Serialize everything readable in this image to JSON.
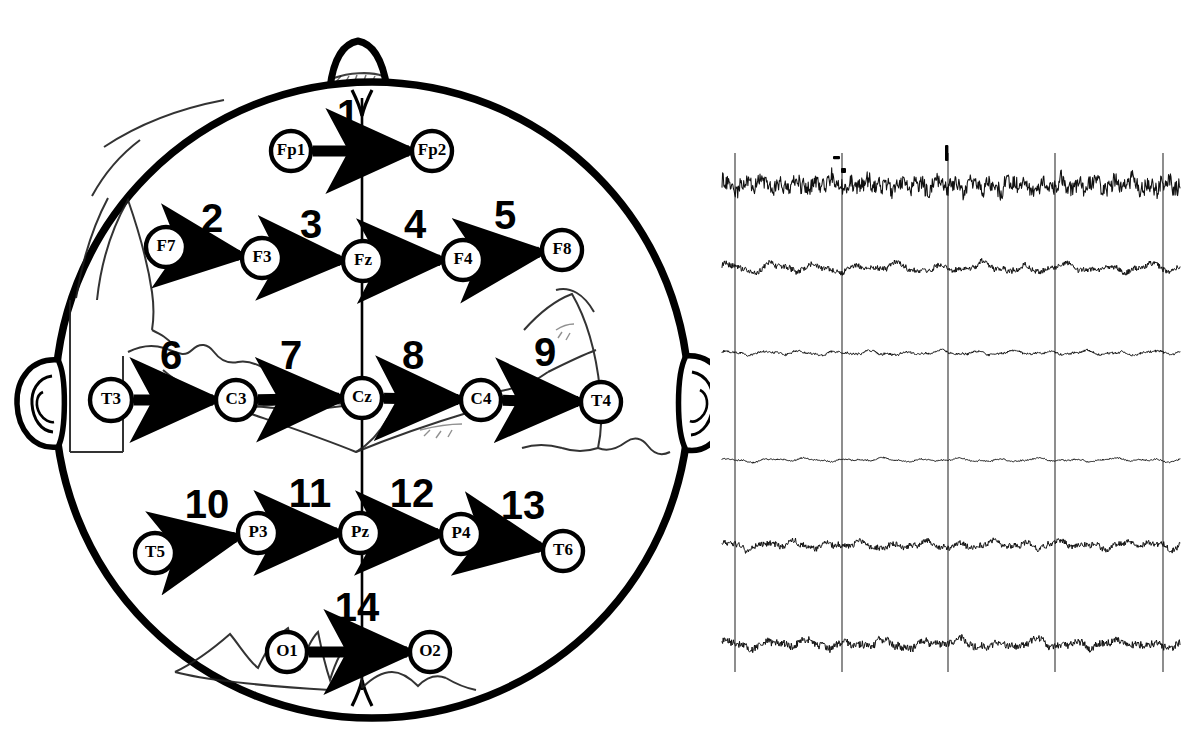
{
  "figure": {
    "kind": "eeg-1020-montage-diagram",
    "top_partial_caption": "",
    "ink_color": "#000000",
    "paper_color": "#ffffff",
    "faint_overlay_color": "#2b2b2b"
  },
  "headmap": {
    "name": "eeg-10-20-head-map",
    "nose_label": "nose",
    "left_ear_label": "left-ear",
    "right_ear_label": "right-ear",
    "midline_label": "midline",
    "electrodes": [
      {
        "id": "Fp1",
        "label": "Fp1",
        "cx": 291,
        "cy": 151,
        "r": 20
      },
      {
        "id": "Fp2",
        "label": "Fp2",
        "cx": 432,
        "cy": 151,
        "r": 20
      },
      {
        "id": "F7",
        "label": "F7",
        "cx": 166,
        "cy": 247,
        "r": 20
      },
      {
        "id": "F3",
        "label": "F3",
        "cx": 262,
        "cy": 258,
        "r": 20
      },
      {
        "id": "Fz",
        "label": "Fz",
        "cx": 363,
        "cy": 261,
        "r": 20
      },
      {
        "id": "F4",
        "label": "F4",
        "cx": 463,
        "cy": 260,
        "r": 20
      },
      {
        "id": "F8",
        "label": "F8",
        "cx": 562,
        "cy": 250,
        "r": 20
      },
      {
        "id": "T3",
        "label": "T3",
        "cx": 111,
        "cy": 400,
        "r": 21
      },
      {
        "id": "C3",
        "label": "C3",
        "cx": 236,
        "cy": 400,
        "r": 20
      },
      {
        "id": "Cz",
        "label": "Cz",
        "cx": 362,
        "cy": 398,
        "r": 20
      },
      {
        "id": "C4",
        "label": "C4",
        "cx": 481,
        "cy": 400,
        "r": 20
      },
      {
        "id": "T4",
        "label": "T4",
        "cx": 601,
        "cy": 402,
        "r": 20
      },
      {
        "id": "T5",
        "label": "T5",
        "cx": 155,
        "cy": 553,
        "r": 20
      },
      {
        "id": "P3",
        "label": "P3",
        "cx": 258,
        "cy": 533,
        "r": 20
      },
      {
        "id": "Pz",
        "label": "Pz",
        "cx": 360,
        "cy": 533,
        "r": 20
      },
      {
        "id": "P4",
        "label": "P4",
        "cx": 461,
        "cy": 534,
        "r": 20
      },
      {
        "id": "T6",
        "label": "T6",
        "cx": 563,
        "cy": 551,
        "r": 20
      },
      {
        "id": "O1",
        "label": "O1",
        "cx": 287,
        "cy": 652,
        "r": 20
      },
      {
        "id": "O2",
        "label": "O2",
        "cx": 430,
        "cy": 652,
        "r": 20
      }
    ],
    "derivations": [
      {
        "n": "1",
        "from": "Fp1",
        "to": "Fp2",
        "num_x": 348,
        "num_y": 128
      },
      {
        "n": "2",
        "from": "F7",
        "to": "F3",
        "num_x": 212,
        "num_y": 232
      },
      {
        "n": "3",
        "from": "F3",
        "to": "Fz",
        "num_x": 311,
        "num_y": 238
      },
      {
        "n": "4",
        "from": "Fz",
        "to": "F4",
        "num_x": 415,
        "num_y": 238
      },
      {
        "n": "5",
        "from": "F4",
        "to": "F8",
        "num_x": 505,
        "num_y": 229
      },
      {
        "n": "6",
        "from": "T3",
        "to": "C3",
        "num_x": 171,
        "num_y": 369
      },
      {
        "n": "7",
        "from": "C3",
        "to": "Cz",
        "num_x": 291,
        "num_y": 369
      },
      {
        "n": "8",
        "from": "Cz",
        "to": "C4",
        "num_x": 413,
        "num_y": 369
      },
      {
        "n": "9",
        "from": "C4",
        "to": "T4",
        "num_x": 545,
        "num_y": 366
      },
      {
        "n": "10",
        "from": "T5",
        "to": "P3",
        "num_x": 207,
        "num_y": 518
      },
      {
        "n": "11",
        "from": "P3",
        "to": "Pz",
        "num_x": 310,
        "num_y": 507
      },
      {
        "n": "12",
        "from": "Pz",
        "to": "P4",
        "num_x": 412,
        "num_y": 507
      },
      {
        "n": "13",
        "from": "P4",
        "to": "T6",
        "num_x": 523,
        "num_y": 519
      },
      {
        "n": "14",
        "from": "O1",
        "to": "O2",
        "num_x": 357,
        "num_y": 621
      }
    ]
  },
  "eeg_panel": {
    "name": "eeg-recording-panel",
    "channel_count": 6,
    "gridline_count": 5,
    "gridline_x": [
      735,
      842,
      948,
      1055,
      1163
    ],
    "gridline_top": 153,
    "gridline_bottom": 672,
    "baselines": [
      185,
      268,
      353,
      460,
      545,
      644
    ],
    "amplitudes": [
      11,
      8,
      4,
      3,
      7,
      8
    ],
    "trace_x_start": 722,
    "trace_x_end": 1180,
    "trace_color": "#111111"
  },
  "chart_data": {
    "type": "line",
    "title": "",
    "xlabel": "",
    "ylabel": "",
    "grid": true,
    "legend": "none",
    "series": [
      {
        "name": "channel-1",
        "baseline": 185,
        "amplitude": 11,
        "roughness": 0.95,
        "hz": 26
      },
      {
        "name": "channel-2",
        "baseline": 268,
        "amplitude": 8,
        "roughness": 0.45,
        "hz": 11
      },
      {
        "name": "channel-3",
        "baseline": 353,
        "amplitude": 4,
        "roughness": 0.35,
        "hz": 13
      },
      {
        "name": "channel-4",
        "baseline": 460,
        "amplitude": 3,
        "roughness": 0.3,
        "hz": 12
      },
      {
        "name": "channel-5",
        "baseline": 545,
        "amplitude": 7,
        "roughness": 0.55,
        "hz": 14
      },
      {
        "name": "channel-6",
        "baseline": 644,
        "amplitude": 8,
        "roughness": 0.6,
        "hz": 12
      }
    ]
  }
}
